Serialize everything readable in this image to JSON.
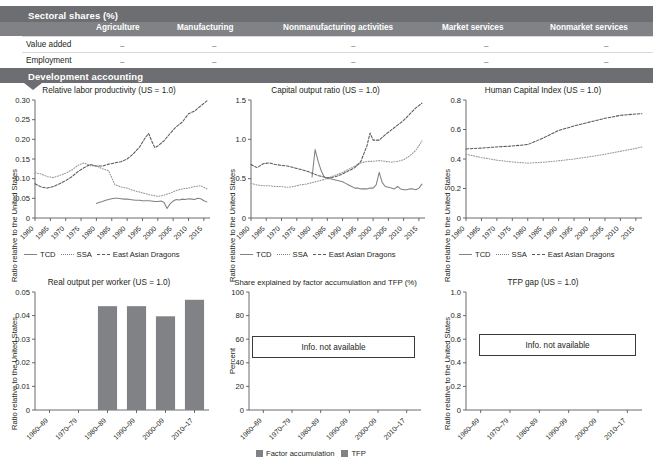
{
  "table": {
    "section_title": "Sectoral shares (%)",
    "columns": [
      "Agriculture",
      "Manufacturing",
      "Nonmanufacturing activities",
      "Market services",
      "Nonmarket services"
    ],
    "rows": [
      {
        "label": "Value added",
        "values": [
          "–",
          "–",
          "–",
          "–",
          "–"
        ]
      },
      {
        "label": "Employment",
        "values": [
          "–",
          "–",
          "–",
          "–",
          "–"
        ]
      }
    ],
    "second_section_title": "Development accounting"
  },
  "legend": {
    "series": [
      "TCD",
      "SSA",
      "East Asian Dragons"
    ],
    "bar_series": [
      "Factor accumulation",
      "TFP"
    ]
  },
  "labels": {
    "y_ratio": "Ratio relative to the United States",
    "y_percent": "Percent",
    "not_available": "Info. not available"
  },
  "colors": {
    "band": "#6d6e71",
    "header_band": "#808285",
    "bar": "#808285",
    "line_tcd": "#808285",
    "line_ssa": "#939598",
    "line_ead": "#58595b",
    "text": "#231f20"
  },
  "chart_data": [
    {
      "id": "relative-labor-productivity",
      "type": "line",
      "title": "Relative labor productivity (US = 1.0)",
      "xlabel": "",
      "ylabel": "Ratio relative to the United States",
      "ylim": [
        0,
        0.3
      ],
      "yticks": [
        0,
        0.05,
        0.1,
        0.15,
        0.2,
        0.25,
        0.3
      ],
      "ytick_labels": [
        "0",
        "0.05",
        "0.10",
        "0.15",
        "0.20",
        "0.25",
        "0.30"
      ],
      "xlim": [
        1960,
        2017
      ],
      "xticks": [
        1960,
        1965,
        1970,
        1975,
        1980,
        1985,
        1990,
        1995,
        2000,
        2005,
        2010,
        2015
      ],
      "grid": false,
      "legend_position": "bottom",
      "series": [
        {
          "name": "TCD",
          "style": "solid",
          "x": [
            1980,
            1981,
            1982,
            1983,
            1984,
            1985,
            1986,
            1987,
            1988,
            1989,
            1990,
            1991,
            1992,
            1993,
            1994,
            1995,
            1996,
            1997,
            1998,
            1999,
            2000,
            2001,
            2002,
            2003,
            2004,
            2005,
            2006,
            2007,
            2008,
            2009,
            2010,
            2011,
            2012,
            2013,
            2014,
            2015,
            2016
          ],
          "values": [
            0.037,
            0.04,
            0.042,
            0.045,
            0.047,
            0.049,
            0.05,
            0.05,
            0.049,
            0.048,
            0.048,
            0.047,
            0.046,
            0.045,
            0.045,
            0.044,
            0.044,
            0.044,
            0.043,
            0.042,
            0.042,
            0.043,
            0.04,
            0.024,
            0.036,
            0.043,
            0.047,
            0.046,
            0.048,
            0.047,
            0.049,
            0.048,
            0.047,
            0.05,
            0.049,
            0.044,
            0.041
          ]
        },
        {
          "name": "SSA",
          "style": "dotted",
          "x": [
            1960,
            1962,
            1964,
            1966,
            1968,
            1970,
            1972,
            1974,
            1976,
            1978,
            1980,
            1982,
            1984,
            1986,
            1988,
            1990,
            1992,
            1994,
            1996,
            1998,
            2000,
            2002,
            2004,
            2006,
            2008,
            2010,
            2012,
            2014,
            2016
          ],
          "values": [
            0.115,
            0.112,
            0.105,
            0.103,
            0.108,
            0.114,
            0.122,
            0.134,
            0.14,
            0.133,
            0.132,
            0.125,
            0.12,
            0.085,
            0.079,
            0.076,
            0.07,
            0.066,
            0.062,
            0.058,
            0.055,
            0.058,
            0.063,
            0.07,
            0.074,
            0.076,
            0.08,
            0.082,
            0.074
          ]
        },
        {
          "name": "East Asian Dragons",
          "style": "dashed",
          "x": [
            1960,
            1962,
            1964,
            1966,
            1968,
            1970,
            1972,
            1974,
            1976,
            1978,
            1980,
            1982,
            1984,
            1986,
            1988,
            1990,
            1992,
            1994,
            1996,
            1997,
            1998,
            1999,
            2000,
            2002,
            2004,
            2006,
            2008,
            2010,
            2012,
            2014,
            2016
          ],
          "values": [
            0.087,
            0.079,
            0.076,
            0.08,
            0.087,
            0.095,
            0.105,
            0.118,
            0.128,
            0.136,
            0.132,
            0.132,
            0.137,
            0.14,
            0.143,
            0.15,
            0.163,
            0.18,
            0.205,
            0.215,
            0.196,
            0.179,
            0.183,
            0.196,
            0.215,
            0.232,
            0.244,
            0.265,
            0.272,
            0.285,
            0.298
          ]
        }
      ]
    },
    {
      "id": "capital-output-ratio",
      "type": "line",
      "title": "Capital output ratio (US = 1.0)",
      "xlabel": "",
      "ylabel": "Ratio relative to the United States",
      "ylim": [
        0,
        1.5
      ],
      "yticks": [
        0,
        0.5,
        1.0,
        1.5
      ],
      "ytick_labels": [
        "0",
        "0.5",
        "1.0",
        "1.5"
      ],
      "xlim": [
        1960,
        2017
      ],
      "xticks": [
        1960,
        1965,
        1970,
        1975,
        1980,
        1985,
        1990,
        1995,
        2000,
        2005,
        2010,
        2015
      ],
      "grid": false,
      "legend_position": "bottom",
      "series": [
        {
          "name": "TCD",
          "style": "solid",
          "x": [
            1980,
            1981,
            1982,
            1983,
            1984,
            1985,
            1986,
            1987,
            1988,
            1989,
            1990,
            1991,
            1992,
            1993,
            1994,
            1995,
            1996,
            1997,
            1998,
            1999,
            2000,
            2001,
            2002,
            2003,
            2004,
            2005,
            2006,
            2007,
            2008,
            2009,
            2010,
            2011,
            2012,
            2013,
            2014,
            2015,
            2016
          ],
          "values": [
            0.52,
            0.87,
            0.72,
            0.6,
            0.52,
            0.5,
            0.5,
            0.49,
            0.48,
            0.47,
            0.46,
            0.44,
            0.42,
            0.4,
            0.38,
            0.38,
            0.37,
            0.37,
            0.37,
            0.38,
            0.38,
            0.42,
            0.58,
            0.45,
            0.4,
            0.39,
            0.38,
            0.37,
            0.4,
            0.37,
            0.36,
            0.36,
            0.37,
            0.37,
            0.36,
            0.38,
            0.43
          ]
        },
        {
          "name": "SSA",
          "style": "dotted",
          "x": [
            1960,
            1962,
            1964,
            1966,
            1968,
            1970,
            1972,
            1974,
            1976,
            1978,
            1980,
            1982,
            1984,
            1986,
            1988,
            1990,
            1992,
            1994,
            1996,
            1998,
            2000,
            2002,
            2004,
            2006,
            2008,
            2010,
            2012,
            2014,
            2016
          ],
          "values": [
            0.44,
            0.42,
            0.41,
            0.41,
            0.4,
            0.4,
            0.39,
            0.4,
            0.42,
            0.43,
            0.45,
            0.47,
            0.49,
            0.52,
            0.55,
            0.58,
            0.62,
            0.66,
            0.7,
            0.72,
            0.72,
            0.73,
            0.72,
            0.71,
            0.72,
            0.74,
            0.79,
            0.86,
            0.98
          ]
        },
        {
          "name": "East Asian Dragons",
          "style": "dashed",
          "x": [
            1960,
            1962,
            1964,
            1966,
            1968,
            1970,
            1972,
            1974,
            1976,
            1978,
            1980,
            1982,
            1984,
            1986,
            1988,
            1990,
            1992,
            1994,
            1996,
            1998,
            1999,
            2000,
            2002,
            2004,
            2006,
            2008,
            2010,
            2012,
            2014,
            2016
          ],
          "values": [
            0.68,
            0.64,
            0.69,
            0.7,
            0.68,
            0.67,
            0.66,
            0.64,
            0.62,
            0.6,
            0.57,
            0.54,
            0.52,
            0.51,
            0.53,
            0.56,
            0.6,
            0.64,
            0.72,
            0.92,
            1.08,
            0.99,
            0.99,
            1.06,
            1.12,
            1.18,
            1.24,
            1.32,
            1.4,
            1.46
          ]
        }
      ]
    },
    {
      "id": "human-capital-index",
      "type": "line",
      "title": "Human Capital Index (US = 1.0)",
      "xlabel": "",
      "ylabel": "Ratio relative to the United States",
      "ylim": [
        0,
        0.8
      ],
      "yticks": [
        0,
        0.2,
        0.4,
        0.6,
        0.8
      ],
      "ytick_labels": [
        "0",
        "0.2",
        "0.4",
        "0.6",
        "0.8"
      ],
      "xlim": [
        1960,
        2017
      ],
      "xticks": [
        1960,
        1965,
        1970,
        1975,
        1980,
        1985,
        1990,
        1995,
        2000,
        2005,
        2010,
        2015
      ],
      "grid": false,
      "legend_position": "bottom",
      "series": [
        {
          "name": "SSA",
          "style": "dotted",
          "x": [
            1960,
            1965,
            1970,
            1975,
            1980,
            1985,
            1990,
            1995,
            2000,
            2005,
            2010,
            2015,
            2017
          ],
          "values": [
            0.432,
            0.41,
            0.392,
            0.38,
            0.372,
            0.378,
            0.388,
            0.4,
            0.415,
            0.432,
            0.452,
            0.472,
            0.482
          ]
        },
        {
          "name": "East Asian Dragons",
          "style": "dashed",
          "x": [
            1960,
            1965,
            1970,
            1975,
            1980,
            1985,
            1990,
            1995,
            2000,
            2005,
            2010,
            2015,
            2017
          ],
          "values": [
            0.468,
            0.474,
            0.482,
            0.488,
            0.498,
            0.542,
            0.594,
            0.624,
            0.65,
            0.676,
            0.696,
            0.705,
            0.707
          ]
        }
      ]
    },
    {
      "id": "real-output-per-worker",
      "type": "bar",
      "title": "Real output per worker (US = 1.0)",
      "xlabel": "",
      "ylabel": "Ratio relative to the United States",
      "ylim": [
        0,
        0.05
      ],
      "yticks": [
        0,
        0.01,
        0.02,
        0.03,
        0.04,
        0.05
      ],
      "ytick_labels": [
        "0",
        "0.01",
        "0.02",
        "0.03",
        "0.04",
        "0.05"
      ],
      "categories": [
        "1960–69",
        "1970–79",
        "1980–89",
        "1990–99",
        "2000–09",
        "2010–17"
      ],
      "values": [
        null,
        null,
        0.044,
        0.044,
        0.0397,
        0.0467
      ],
      "grid": false
    },
    {
      "id": "share-factor-accumulation-tfp",
      "type": "bar",
      "title": "Share explained by factor accumulation and TFP (%)",
      "xlabel": "",
      "ylabel": "Percent",
      "ylim": [
        0,
        100
      ],
      "yticks": [
        0,
        20,
        40,
        60,
        80,
        100
      ],
      "ytick_labels": [
        "0",
        "20",
        "40",
        "60",
        "80",
        "100"
      ],
      "categories": [
        "1960–69",
        "1970–79",
        "1980–89",
        "1990–99",
        "2000–09",
        "2010–17"
      ],
      "series": [
        {
          "name": "Factor accumulation",
          "values": [
            null,
            null,
            null,
            null,
            null,
            null
          ]
        },
        {
          "name": "TFP",
          "values": [
            null,
            null,
            null,
            null,
            null,
            null
          ]
        }
      ],
      "annotation": "Info. not available",
      "grid": false,
      "legend_position": "bottom"
    },
    {
      "id": "tfp-gap",
      "type": "bar",
      "title": "TFP gap (US = 1.0)",
      "xlabel": "",
      "ylabel": "Ratio relative to the United States",
      "ylim": [
        0,
        1.0
      ],
      "yticks": [
        0,
        0.2,
        0.4,
        0.6,
        0.8,
        1.0
      ],
      "ytick_labels": [
        "0",
        "0.2",
        "0.4",
        "0.6",
        "0.8",
        "1.0"
      ],
      "categories": [
        "1960–69",
        "1970–79",
        "1980–89",
        "1990–99",
        "2000–09",
        "2010–17"
      ],
      "values": [
        null,
        null,
        null,
        null,
        null,
        null
      ],
      "annotation": "Info. not available",
      "grid": false
    }
  ]
}
